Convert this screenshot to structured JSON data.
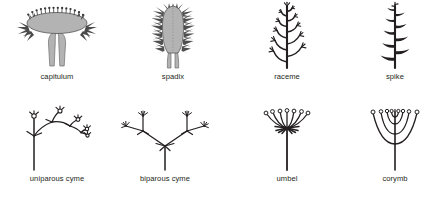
{
  "figure": {
    "background_color": "#ffffff",
    "ink_color": "#231f20",
    "fill_color": "#b3b3b3",
    "caption_color": "#231f20"
  },
  "items": [
    {
      "id": "capitulum",
      "label": "capitulum",
      "type": "racemose",
      "description": "Flat broad receptacle bearing many sessile florets on its upper surface, surrounded by involucral bracts, borne on a single stout stalk."
    },
    {
      "id": "spadix",
      "label": "spadix",
      "type": "racemose",
      "description": "Thick fleshy elongated axis bearing many sessile florets along both sides, tapering to a short stalk."
    },
    {
      "id": "raceme",
      "label": "raceme",
      "type": "racemose",
      "description": "Elongated unbranched axis bearing stalked (pedicellate) flowers, oldest at the base and youngest at the tip."
    },
    {
      "id": "spike",
      "label": "spike",
      "type": "racemose",
      "description": "Elongated unbranched axis bearing sessile flowers directly on the axis, alternating along its length."
    },
    {
      "id": "uniparous-cyme",
      "label": "uniparous cyme",
      "type": "cymose",
      "description": "Terminal flower with a single lateral branch repeatedly produced, forming a zig-zag helicoid series."
    },
    {
      "id": "biparous-cyme",
      "label": "biparous cyme",
      "type": "cymose",
      "description": "Terminal flower with two opposite lateral branches, each repeating the pattern to form a dichasium."
    },
    {
      "id": "umbel",
      "label": "umbel",
      "type": "racemose",
      "description": "Pedicels of nearly equal length all arising from one point at the tip of the axis."
    },
    {
      "id": "corymb",
      "label": "corymb",
      "type": "racemose",
      "description": "Pedicels of unequal length arising at different levels on the axis, bringing all flowers to the same level."
    }
  ]
}
